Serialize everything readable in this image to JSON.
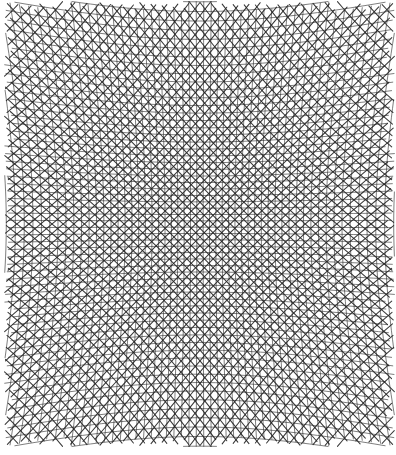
{
  "artwork": {
    "title": "Warped Woven Grid (Moire Lattice)",
    "medium": "pen and ink on paper",
    "description": "Dense interference lattice of two families of curved lines bowing radially about the centre, producing a pincushion moire weave.",
    "canvas": {
      "width": 396,
      "height": 455
    },
    "background_color": "#ffffff",
    "ink_color": "#1a1a1a"
  },
  "plate": {
    "left": 5,
    "top": 2,
    "right": 394,
    "bottom": 446,
    "width": 389,
    "height": 444
  },
  "pattern": {
    "type": "crossed-curved-grid",
    "families": [
      {
        "name": "family-a",
        "nominal_angle_deg": 45,
        "line_count": 96,
        "spacing_px": 6.1,
        "stroke_width": 1.05,
        "color": "#232323",
        "opacity": 0.9
      },
      {
        "name": "family-b",
        "nominal_angle_deg": -45,
        "line_count": 96,
        "spacing_px": 6.1,
        "stroke_width": 1.05,
        "color": "#232323",
        "opacity": 0.9
      },
      {
        "name": "family-c",
        "nominal_angle_deg": 0,
        "line_count": 72,
        "spacing_px": 6.3,
        "stroke_width": 0.85,
        "color": "#2b2b2b",
        "opacity": 0.72
      },
      {
        "name": "family-d",
        "nominal_angle_deg": 90,
        "line_count": 64,
        "spacing_px": 6.3,
        "stroke_width": 0.85,
        "color": "#2b2b2b",
        "opacity": 0.72
      }
    ],
    "distortion": {
      "model": "radial-pincushion",
      "center_x": 200,
      "center_y": 224,
      "strength": 0.46,
      "falloff": 1.85
    },
    "density": {
      "center": "sparse-fine",
      "edges": "dense-dark",
      "corners": "darkest"
    }
  },
  "chart_data": {
    "type": "scatter",
    "xlabel": "",
    "ylabel": "",
    "xlim": [
      5,
      394
    ],
    "ylim": [
      2,
      446
    ],
    "grid": true,
    "legend_position": "none",
    "series": [
      {
        "name": "diagonal family +45",
        "values": []
      },
      {
        "name": "diagonal family -45",
        "values": []
      },
      {
        "name": "horizontal family",
        "values": []
      },
      {
        "name": "vertical family",
        "values": []
      }
    ]
  }
}
